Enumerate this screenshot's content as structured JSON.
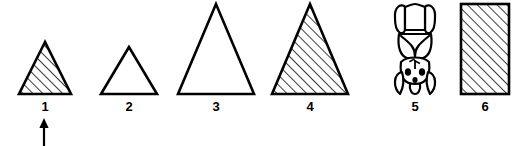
{
  "figure": {
    "type": "scientific-specimen-series",
    "width": 522,
    "height": 146,
    "background_color": "#ffffff",
    "ink_color": "#000000",
    "hatch_color": "#1a1a1a"
  },
  "items": [
    {
      "label": "1",
      "icon": "hatched-triangle-small-icon",
      "shape": "triangle",
      "fill": "diagonal-hatch",
      "hatch_direction": "lower-left-to-upper-right",
      "slot_x": 8,
      "slot_width": 74,
      "apex_y": 42,
      "base_y": 94,
      "base_width": 52,
      "label_y": 100,
      "has_pointer": true,
      "pointer": {
        "icon": "up-arrow-icon",
        "direction": "up",
        "x": 44,
        "top_y": 118,
        "bottom_y": 144
      }
    },
    {
      "label": "2",
      "icon": "outline-triangle-small-icon",
      "shape": "triangle",
      "fill": "none",
      "hatch_direction": "",
      "slot_x": 90,
      "slot_width": 78,
      "apex_y": 47,
      "base_y": 94,
      "base_width": 56,
      "label_y": 100,
      "has_pointer": false,
      "pointer": null
    },
    {
      "label": "3",
      "icon": "outline-triangle-large-icon",
      "shape": "triangle",
      "fill": "none",
      "hatch_direction": "",
      "slot_x": 168,
      "slot_width": 96,
      "apex_y": 4,
      "base_y": 94,
      "base_width": 76,
      "label_y": 100,
      "has_pointer": false,
      "pointer": null
    },
    {
      "label": "4",
      "icon": "hatched-triangle-large-icon",
      "shape": "triangle",
      "fill": "diagonal-hatch",
      "hatch_direction": "lower-left-to-upper-right",
      "slot_x": 262,
      "slot_width": 96,
      "apex_y": 4,
      "base_y": 94,
      "base_width": 76,
      "label_y": 100,
      "has_pointer": false,
      "pointer": null
    },
    {
      "label": "5",
      "icon": "anatomical-specimen-icon",
      "shape": "organic-specimen",
      "fill": "outline-with-dark-spots",
      "hatch_direction": "",
      "slot_x": 382,
      "slot_width": 66,
      "apex_y": 4,
      "base_y": 94,
      "base_width": 44,
      "label_y": 100,
      "has_pointer": false,
      "pointer": null
    },
    {
      "label": "6",
      "icon": "hatched-rectangle-icon",
      "shape": "rectangle",
      "fill": "diagonal-hatch",
      "hatch_direction": "lower-left-to-upper-right",
      "slot_x": 452,
      "slot_width": 66,
      "apex_y": 4,
      "base_y": 94,
      "base_width": 48,
      "label_y": 100,
      "has_pointer": false,
      "pointer": null
    }
  ]
}
